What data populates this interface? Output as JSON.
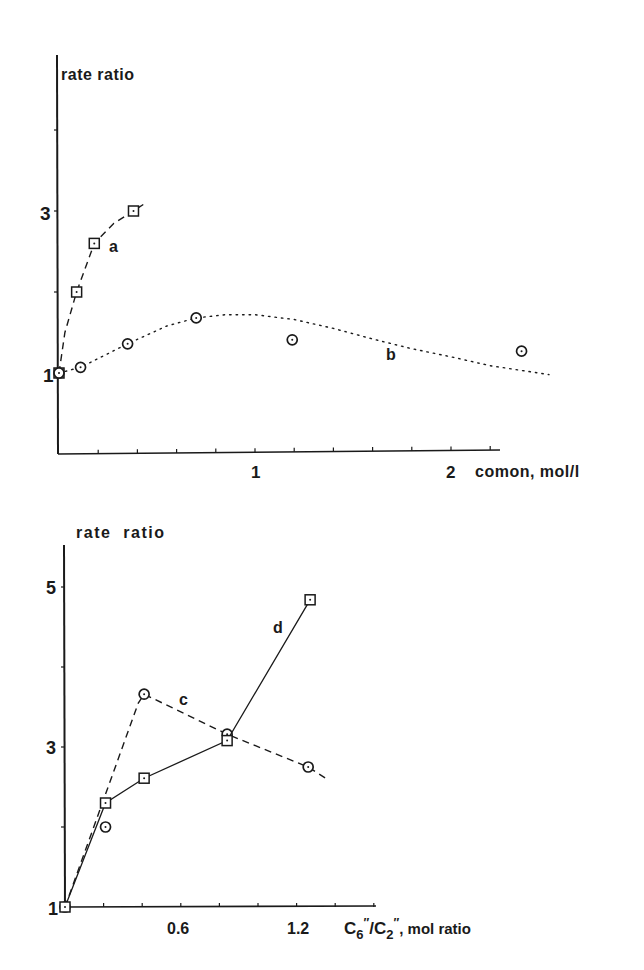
{
  "chart_data": [
    {
      "type": "line",
      "title": "",
      "xlabel": "comon, mol/l",
      "ylabel": "rate ratio",
      "xlim": [
        0,
        2.25
      ],
      "ylim": [
        0,
        4.9
      ],
      "xticks": [
        0.2,
        0.4,
        0.6,
        0.8,
        1.0,
        1.2,
        1.4,
        1.6,
        1.8,
        2.0,
        2.2
      ],
      "xtick_labels": [
        {
          "value": 1,
          "label": "1"
        },
        {
          "value": 2,
          "label": "2"
        }
      ],
      "yticks": [
        1,
        2,
        3,
        4
      ],
      "ytick_labels": [
        {
          "value": 1,
          "label": "1"
        },
        {
          "value": 3,
          "label": "3"
        }
      ],
      "grid": false,
      "legend": "inline labels",
      "series": [
        {
          "name": "a",
          "marker": "square",
          "line_style": "dashed",
          "points": [
            [
              0,
              1.0
            ],
            [
              0.09,
              2.0
            ],
            [
              0.18,
              2.6
            ],
            [
              0.38,
              3.0
            ]
          ],
          "curve": [
            [
              0,
              1.0
            ],
            [
              0.03,
              1.5
            ],
            [
              0.09,
              2.0
            ],
            [
              0.18,
              2.6
            ],
            [
              0.28,
              2.85
            ],
            [
              0.38,
              3.0
            ],
            [
              0.43,
              3.08
            ]
          ],
          "label_pos": [
            0.27,
            2.55
          ]
        },
        {
          "name": "b",
          "marker": "circle",
          "line_style": "dotted",
          "points": [
            [
              0,
              1.0
            ],
            [
              0.11,
              1.07
            ],
            [
              0.35,
              1.36
            ],
            [
              0.7,
              1.68
            ],
            [
              1.19,
              1.41
            ],
            [
              2.36,
              1.27
            ]
          ],
          "curve": [
            [
              0,
              1.0
            ],
            [
              0.11,
              1.07
            ],
            [
              0.35,
              1.36
            ],
            [
              0.55,
              1.58
            ],
            [
              0.7,
              1.68
            ],
            [
              0.85,
              1.72
            ],
            [
              1.0,
              1.72
            ],
            [
              1.2,
              1.66
            ],
            [
              1.4,
              1.55
            ],
            [
              1.6,
              1.42
            ],
            [
              1.8,
              1.3
            ],
            [
              2.0,
              1.2
            ],
            [
              2.2,
              1.09
            ],
            [
              2.5,
              0.98
            ]
          ],
          "label_pos": [
            1.55,
            1.2
          ]
        }
      ]
    },
    {
      "type": "line",
      "title": "",
      "xlabel": "C6\"/C2\", mol ratio",
      "ylabel": "rate ratio",
      "xlim": [
        0,
        1.6
      ],
      "ylim": [
        1,
        5.5
      ],
      "xticks": [
        0.2,
        0.4,
        0.6,
        0.8,
        1.0,
        1.2,
        1.4,
        1.6
      ],
      "xtick_labels": [
        {
          "value": 0.6,
          "label": "0.6"
        },
        {
          "value": 1.2,
          "label": "1.2"
        }
      ],
      "yticks": [
        2,
        3,
        4,
        5
      ],
      "ytick_labels": [
        {
          "value": 1,
          "label": "1"
        },
        {
          "value": 3,
          "label": "3"
        },
        {
          "value": 5,
          "label": "5"
        }
      ],
      "grid": false,
      "legend": "inline labels",
      "series": [
        {
          "name": "c",
          "marker": "circle",
          "line_style": "dashed",
          "points": [
            [
              0,
              1.0
            ],
            [
              0.21,
              2.0
            ],
            [
              0.41,
              3.66
            ],
            [
              0.84,
              3.16
            ],
            [
              1.26,
              2.75
            ]
          ],
          "curve": [
            [
              0,
              1.0
            ],
            [
              0.38,
              3.55
            ],
            [
              0.41,
              3.66
            ],
            [
              0.84,
              3.16
            ],
            [
              1.26,
              2.75
            ],
            [
              1.35,
              2.61
            ]
          ],
          "label_pos": [
            0.6,
            3.55
          ]
        },
        {
          "name": "d",
          "marker": "square",
          "line_style": "solid",
          "points": [
            [
              0,
              1.0
            ],
            [
              0.21,
              2.3
            ],
            [
              0.41,
              2.61
            ],
            [
              0.84,
              3.08
            ],
            [
              1.27,
              4.84
            ]
          ],
          "curve": [
            [
              0,
              1.0
            ],
            [
              0.21,
              2.3
            ],
            [
              0.41,
              2.61
            ],
            [
              0.84,
              3.08
            ],
            [
              1.27,
              4.84
            ]
          ],
          "label_pos": [
            1.08,
            4.35
          ]
        }
      ]
    }
  ],
  "labels": {
    "top_ylabel": "rate ratio",
    "top_xlabel": "comon, mol/l",
    "top_y1": "1",
    "top_y3": "3",
    "top_x1": "1",
    "top_x2": "2",
    "bottom_ylabel": "rate ratio",
    "bottom_xlabel_tail": ", mol ratio",
    "bottom_xlabel_c": "C",
    "bottom_xlabel_sub6": "6",
    "bottom_xlabel_sub2": "2",
    "bottom_y1": "1",
    "bottom_y3": "3",
    "bottom_y5": "5",
    "bottom_x06": "0.6",
    "bottom_x12": "1.2",
    "series_a": "a",
    "series_b": "b",
    "series_c": "c",
    "series_d": "d"
  }
}
